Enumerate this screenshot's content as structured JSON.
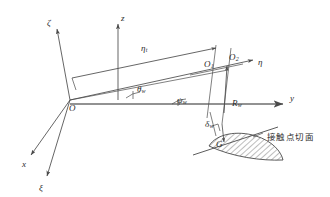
{
  "figure": {
    "type": "engineering-schematic",
    "background_color": "#ffffff",
    "line_color": "#4a4a4a",
    "text_color": "#2b2b2b"
  },
  "axes": [
    {
      "id": "z",
      "label": "z",
      "sub": "",
      "x": 121,
      "y": 14,
      "desc": "vertical-axis-z"
    },
    {
      "id": "zeta",
      "label": "ζ",
      "sub": "",
      "x": 47,
      "y": 19,
      "desc": "axis-zeta-upper"
    },
    {
      "id": "eta",
      "label": "η",
      "sub": "",
      "x": 258,
      "y": 58,
      "desc": "axis-eta"
    },
    {
      "id": "y",
      "label": "y",
      "sub": "",
      "x": 290,
      "y": 94,
      "desc": "axis-y"
    },
    {
      "id": "x",
      "label": "x",
      "sub": "",
      "x": 22,
      "y": 160,
      "desc": "axis-x"
    },
    {
      "id": "xi",
      "label": "ξ",
      "sub": "",
      "x": 39,
      "y": 184,
      "desc": "axis-xi-lower"
    }
  ],
  "points": [
    {
      "id": "O",
      "label": "O",
      "sub": "",
      "x": 69,
      "y": 104,
      "desc": "origin-point-O"
    },
    {
      "id": "O1",
      "label": "O",
      "sub": "1",
      "x": 204,
      "y": 60,
      "desc": "point-O1"
    },
    {
      "id": "O2",
      "label": "O",
      "sub": "2",
      "x": 229,
      "y": 53,
      "desc": "point-O2"
    },
    {
      "id": "G",
      "label": "G",
      "sub": "",
      "x": 216,
      "y": 140,
      "desc": "contact-point-G"
    }
  ],
  "measures": [
    {
      "id": "eta_t",
      "label": "η",
      "sub": "t",
      "x": 141,
      "y": 44,
      "desc": "dimension-eta-t"
    },
    {
      "id": "theta_w",
      "label": "θ",
      "sub": "w",
      "x": 137,
      "y": 85,
      "desc": "angle-theta-w"
    },
    {
      "id": "psi_w",
      "label": "ψ",
      "sub": "w",
      "x": 177,
      "y": 96,
      "desc": "angle-psi-w"
    },
    {
      "id": "R_w",
      "label": "R",
      "sub": "w",
      "x": 232,
      "y": 99,
      "desc": "radius-R-w"
    },
    {
      "id": "delta_w",
      "label": "δ",
      "sub": "w",
      "x": 205,
      "y": 120,
      "desc": "angle-delta-w"
    }
  ],
  "annotations": [
    {
      "id": "tangent_plane",
      "text": "接触点切面",
      "x": 267,
      "y": 133,
      "desc": "contact-point-tangent-plane-label"
    }
  ]
}
